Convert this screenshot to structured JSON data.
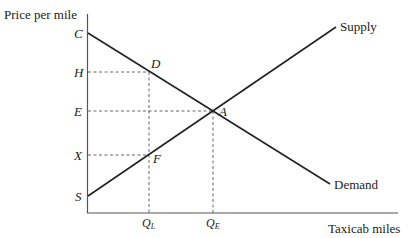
{
  "diagram": {
    "y_axis_label": "Price per mile",
    "x_axis_label": "Taxicab miles",
    "curves": {
      "supply": {
        "label": "Supply"
      },
      "demand": {
        "label": "Demand"
      }
    },
    "price_labels": {
      "C": "C",
      "H": "H",
      "E": "E",
      "X": "X",
      "S": "S"
    },
    "points": {
      "A": "A",
      "D": "D",
      "F": "F"
    },
    "quantity_labels": {
      "QL": {
        "main": "Q",
        "sub": "L"
      },
      "QE": {
        "main": "Q",
        "sub": "E"
      }
    },
    "colors": {
      "line": "#222222",
      "axis": "#555555",
      "background": "#ffffff"
    }
  }
}
